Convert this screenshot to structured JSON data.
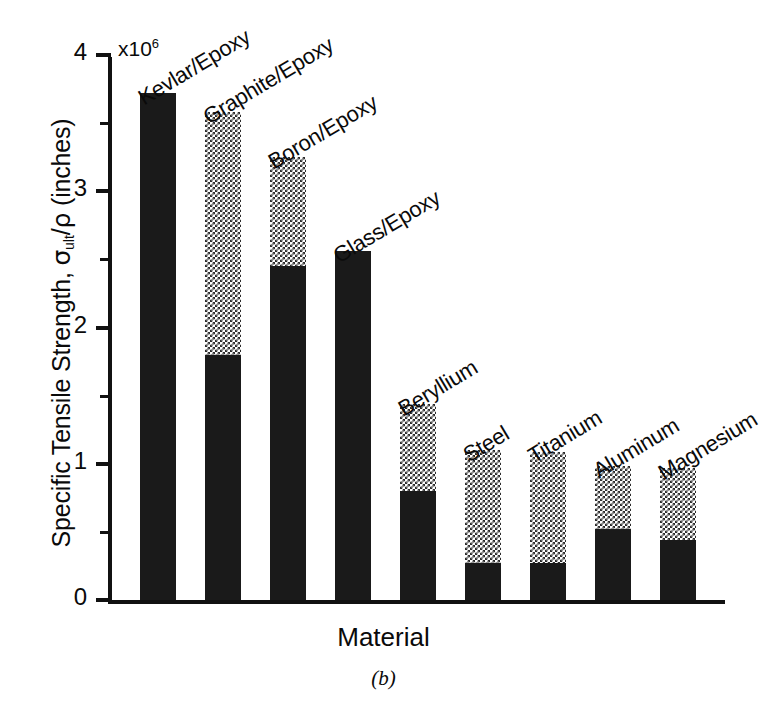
{
  "chart_data": {
    "type": "bar",
    "title": "",
    "subtitle": "",
    "caption": "(b)",
    "xlabel": "Material",
    "ylabel": "Specific Tensile Strength, σult/ρ  (inches)",
    "ylabel_parts": {
      "lead": "Specific Tensile Strength, ",
      "sigma": "σ",
      "subscript": "ult",
      "divider": "/",
      "rho": "ρ",
      "units": "  (inches)"
    },
    "y_exponent_note": "x10",
    "y_exponent_power": "6",
    "y_unit_multiplier": 1000000,
    "ylim": [
      0,
      4
    ],
    "xlim_categories": 9,
    "grid": false,
    "legend": null,
    "y_major_ticks": [
      "0",
      "1",
      "2",
      "3",
      "4"
    ],
    "y_major_tick_values": [
      0,
      1,
      2,
      3,
      4
    ],
    "y_minor_tick_values": [
      0.5,
      1.5,
      2.5,
      3.5
    ],
    "stacked": true,
    "segments": [
      {
        "name": "solid-lower-segment",
        "fill": "solid-black",
        "color": "#1a1a1a"
      },
      {
        "name": "dotted-upper-segment",
        "fill": "checkered-dither",
        "color": "#2b2b2b"
      }
    ],
    "categories": [
      "Kevlar/Epoxy",
      "Graphite/Epoxy",
      "Boron/Epoxy",
      "Glass/Epoxy",
      "Beryllium",
      "Steel",
      "Titanium",
      "Aluminum",
      "Magnesium"
    ],
    "series": [
      {
        "name": "solid-lower-segment",
        "values": [
          3.72,
          1.8,
          2.45,
          2.56,
          0.8,
          0.27,
          0.27,
          0.52,
          0.44
        ]
      },
      {
        "name": "dotted-upper-segment",
        "values": [
          0.0,
          1.78,
          0.8,
          0.0,
          0.64,
          0.83,
          0.82,
          0.46,
          0.53
        ]
      }
    ],
    "totals": [
      3.72,
      3.58,
      3.25,
      2.56,
      1.44,
      1.1,
      1.09,
      0.98,
      0.97
    ],
    "bars": [
      {
        "category": "Kevlar/Epoxy",
        "total": 3.72,
        "solid": 3.72,
        "dotted": 0.0
      },
      {
        "category": "Graphite/Epoxy",
        "total": 3.58,
        "solid": 1.8,
        "dotted": 1.78
      },
      {
        "category": "Boron/Epoxy",
        "total": 3.25,
        "solid": 2.45,
        "dotted": 0.8
      },
      {
        "category": "Glass/Epoxy",
        "total": 2.56,
        "solid": 2.56,
        "dotted": 0.0
      },
      {
        "category": "Beryllium",
        "total": 1.44,
        "solid": 0.8,
        "dotted": 0.64
      },
      {
        "category": "Steel",
        "total": 1.1,
        "solid": 0.27,
        "dotted": 0.83
      },
      {
        "category": "Titanium",
        "total": 1.09,
        "solid": 0.27,
        "dotted": 0.82
      },
      {
        "category": "Aluminum",
        "total": 0.98,
        "solid": 0.52,
        "dotted": 0.46
      },
      {
        "category": "Magnesium",
        "total": 0.97,
        "solid": 0.44,
        "dotted": 0.53
      }
    ]
  },
  "colors": {
    "background": "#ffffff",
    "ink": "#111111",
    "bar_solid": "#1a1a1a",
    "bar_pattern": "#2b2b2b"
  }
}
